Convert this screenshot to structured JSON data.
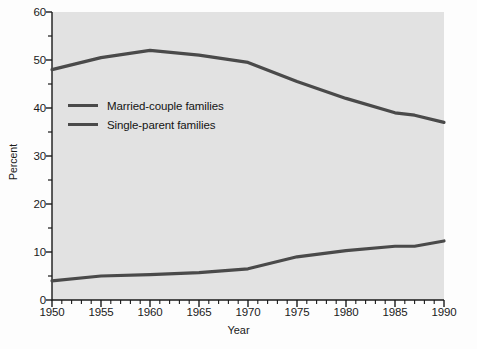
{
  "chart_data": {
    "type": "line",
    "title": "",
    "xlabel": "Year",
    "ylabel": "Percent",
    "xlim": [
      1950,
      1990
    ],
    "ylim": [
      0,
      60
    ],
    "grid": false,
    "legend_position": "upper-left-inside",
    "x_ticks": [
      1950,
      1955,
      1960,
      1965,
      1970,
      1975,
      1980,
      1985,
      1990
    ],
    "x_tick_labels": [
      "1950",
      "1955",
      "1960",
      "1965",
      "1970",
      "1975",
      "1980",
      "1985",
      "1990"
    ],
    "x_minor_tick_step": 1,
    "y_ticks": [
      0,
      10,
      20,
      30,
      40,
      50,
      60
    ],
    "y_tick_labels": [
      "0",
      "10",
      "20",
      "30",
      "40",
      "50",
      "60"
    ],
    "y_minor_tick_step": 5,
    "series": [
      {
        "name": "Married-couple families",
        "color": "#4a4a4a",
        "x": [
          1950,
          1955,
          1960,
          1965,
          1970,
          1975,
          1980,
          1985,
          1987,
          1990
        ],
        "values": [
          48.0,
          50.5,
          52.0,
          51.0,
          49.5,
          45.5,
          42.0,
          39.0,
          38.5,
          37.0
        ]
      },
      {
        "name": "Single-parent families",
        "color": "#4a4a4a",
        "x": [
          1950,
          1955,
          1960,
          1965,
          1970,
          1975,
          1980,
          1985,
          1987,
          1990
        ],
        "values": [
          4.0,
          5.0,
          5.3,
          5.7,
          6.5,
          9.0,
          10.3,
          11.2,
          11.2,
          12.3
        ]
      }
    ]
  },
  "style": {
    "plot_background": "#e2e2e2",
    "figure_background": "#fdfdfd",
    "line_color": "#4a4a4a",
    "axis_color": "#1a1a1a",
    "text_color": "#1a1a1a"
  }
}
